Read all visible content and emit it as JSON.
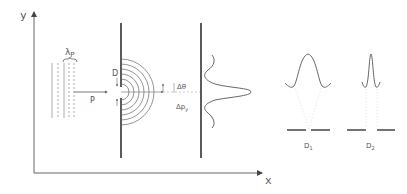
{
  "axes": {
    "x_label": "x",
    "y_label": "y"
  },
  "labels": {
    "wavelength": "λ",
    "wavelength_sub": "P",
    "momentum": "P",
    "slit_width": "D",
    "angle_spread": "Δθ",
    "momentum_spread": "Δp",
    "momentum_spread_sub": "y",
    "detector1": "D",
    "detector1_sub": "1",
    "detector2": "D",
    "detector2_sub": "2"
  },
  "colors": {
    "line": "#555555",
    "barrier": "#333333",
    "dotted": "#bbbbbb"
  }
}
